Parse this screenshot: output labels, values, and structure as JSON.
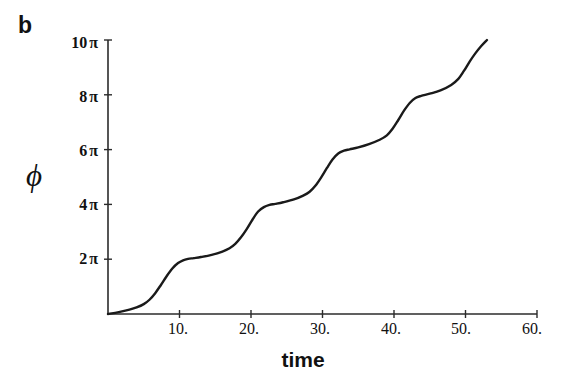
{
  "panel": {
    "label": "b"
  },
  "chart_data": {
    "type": "line",
    "title": "",
    "subtitle": "",
    "xlabel": "time",
    "ylabel": "ϕ",
    "xlim": [
      0,
      60
    ],
    "ylim": [
      0,
      10
    ],
    "y_unit": "π",
    "grid": false,
    "legend": null,
    "xticks": [
      10,
      20,
      30,
      40,
      50,
      60
    ],
    "xtick_labels": [
      "10.",
      "20.",
      "30.",
      "40.",
      "50.",
      "60."
    ],
    "yticks": [
      2,
      4,
      6,
      8,
      10
    ],
    "ytick_labels": [
      "2 π",
      "4 π",
      "6 π",
      "8 π",
      "10 π"
    ],
    "ytick_numbers": [
      "2",
      "4",
      "6",
      "8",
      "10"
    ],
    "ytick_pi": "π",
    "line_color": "#1a1a1a",
    "line_width": 2.4,
    "axis_color": "#2b2b2b",
    "background": "#ffffff",
    "series": [
      {
        "name": "phase",
        "x": [
          0.0,
          1.5,
          3.0,
          4.0,
          5.0,
          5.8,
          6.6,
          7.4,
          8.2,
          9.0,
          9.8,
          10.5,
          11.2,
          12.0,
          13.0,
          14.5,
          16.0,
          17.0,
          17.8,
          18.6,
          19.4,
          20.2,
          21.0,
          21.8,
          22.6,
          23.4,
          24.5,
          26.0,
          27.3,
          28.2,
          29.0,
          29.8,
          30.6,
          31.4,
          32.2,
          33.0,
          33.8,
          35.0,
          36.5,
          38.0,
          39.0,
          39.8,
          40.6,
          41.4,
          42.2,
          43.0,
          43.8,
          45.0,
          46.5,
          48.0,
          49.0,
          49.8,
          50.6,
          51.4,
          52.2,
          53.0
        ],
        "y": [
          0.0,
          0.07,
          0.16,
          0.24,
          0.36,
          0.52,
          0.76,
          1.06,
          1.38,
          1.66,
          1.86,
          1.96,
          2.01,
          2.04,
          2.08,
          2.16,
          2.28,
          2.4,
          2.56,
          2.8,
          3.1,
          3.44,
          3.74,
          3.9,
          3.98,
          4.02,
          4.08,
          4.18,
          4.32,
          4.46,
          4.68,
          4.98,
          5.32,
          5.64,
          5.86,
          5.96,
          6.01,
          6.08,
          6.2,
          6.36,
          6.52,
          6.76,
          7.08,
          7.42,
          7.7,
          7.88,
          7.96,
          8.04,
          8.16,
          8.36,
          8.58,
          8.88,
          9.22,
          9.52,
          9.78,
          10.0
        ]
      }
    ]
  }
}
